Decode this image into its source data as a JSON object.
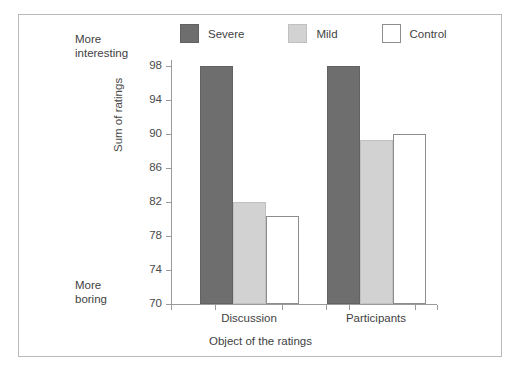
{
  "figure": {
    "border_color": "#b9b9b9"
  },
  "legend": {
    "position": "top-center",
    "entries": [
      {
        "label": "Severe",
        "color": "#6e6e6e",
        "swatch": "filled-dark-square"
      },
      {
        "label": "Mild",
        "color": "#d2d2d2",
        "swatch": "filled-light-square"
      },
      {
        "label": "Control",
        "color": "#ffffff",
        "swatch": "empty-square"
      }
    ]
  },
  "pole_labels": {
    "top_line1": "More",
    "top_line2": "interesting",
    "bottom_line1": "More",
    "bottom_line2": "boring"
  },
  "chart_data": {
    "type": "bar",
    "title": "",
    "subtitle": "",
    "xlabel": "Object of the ratings",
    "ylabel": "Sum of ratings",
    "categories": [
      "Discussion",
      "Participants"
    ],
    "series": [
      {
        "name": "Severe",
        "color": "#6e6e6e",
        "values": [
          98,
          98
        ]
      },
      {
        "name": "Mild",
        "color": "#d2d2d2",
        "values": [
          82,
          89.3
        ]
      },
      {
        "name": "Control",
        "color": "#ffffff",
        "values": [
          80.3,
          90
        ]
      }
    ],
    "ylim": [
      70,
      98
    ],
    "yticks": [
      70,
      74,
      78,
      82,
      86,
      90,
      94,
      98
    ],
    "ytick_labels": [
      "70",
      "74",
      "78",
      "82",
      "86",
      "90",
      "94",
      "98"
    ],
    "grid": false,
    "legend_position": "top",
    "annotations": [
      "More interesting (high end of y-axis)",
      "More boring (low end of y-axis)"
    ]
  }
}
